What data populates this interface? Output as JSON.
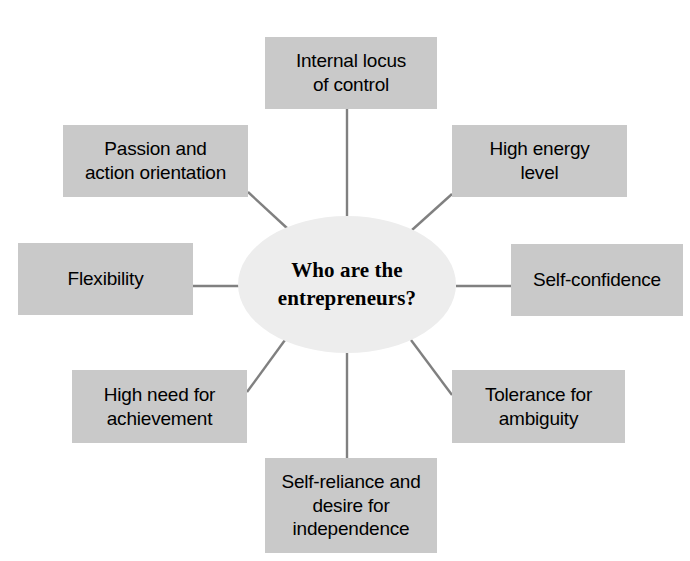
{
  "diagram": {
    "title": "Who are the entrepreneurs?",
    "center": {
      "label": "Who are the\nentrepreneurs?",
      "fill_color": "#ededed"
    },
    "style": {
      "box_fill_color": "#c9c9c9",
      "connector_color": "#808080",
      "text_color": "#000000",
      "background_color": "#ffffff"
    },
    "nodes": [
      {
        "id": "internal-locus-of-control",
        "label": "Internal locus\nof control",
        "position": "top"
      },
      {
        "id": "high-energy-level",
        "label": "High energy\nlevel",
        "position": "top-right"
      },
      {
        "id": "self-confidence",
        "label": "Self-confidence",
        "position": "right"
      },
      {
        "id": "tolerance-for-ambiguity",
        "label": "Tolerance for\nambiguity",
        "position": "bottom-right"
      },
      {
        "id": "self-reliance-and-desire-for-independence",
        "label": "Self-reliance and\ndesire for\nindependence",
        "position": "bottom"
      },
      {
        "id": "high-need-for-achievement",
        "label": "High need for\nachievement",
        "position": "bottom-left"
      },
      {
        "id": "flexibility",
        "label": "Flexibility",
        "position": "left"
      },
      {
        "id": "passion-and-action-orientation",
        "label": "Passion and\naction orientation",
        "position": "top-left"
      }
    ]
  }
}
